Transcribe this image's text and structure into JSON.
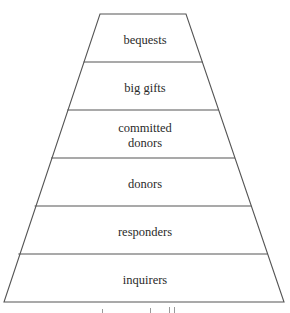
{
  "diagram": {
    "type": "pyramid",
    "stroke_color": "#555555",
    "fill_color": "#ffffff",
    "geometry": {
      "top_y": 14,
      "top_left_x": 100,
      "top_right_x": 186,
      "bottom_y": 302,
      "bottom_left_x": 4,
      "bottom_right_x": 284
    },
    "tiers": [
      {
        "label": "bequests"
      },
      {
        "label": "big gifts"
      },
      {
        "label_line1": "committed",
        "label_line2": "donors"
      },
      {
        "label": "donors"
      },
      {
        "label": "responders"
      },
      {
        "label": "inquirers"
      }
    ]
  }
}
